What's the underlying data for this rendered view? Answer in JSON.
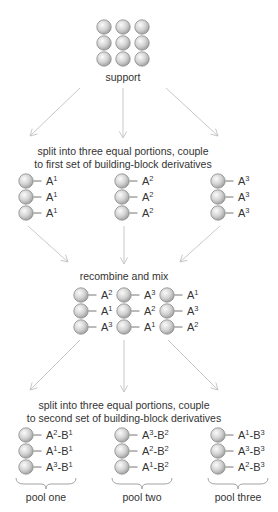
{
  "support": {
    "label": "support",
    "grid": {
      "rows": 3,
      "cols": 3
    }
  },
  "step1": {
    "caption_line1": "split into three equal portions, couple",
    "caption_line2": "to first set of building-block derivatives",
    "groups": [
      {
        "labels": [
          [
            "A",
            "1",
            ""
          ],
          [
            "A",
            "1",
            ""
          ],
          [
            "A",
            "1",
            ""
          ]
        ]
      },
      {
        "labels": [
          [
            "A",
            "2",
            ""
          ],
          [
            "A",
            "2",
            ""
          ],
          [
            "A",
            "2",
            ""
          ]
        ]
      },
      {
        "labels": [
          [
            "A",
            "3",
            ""
          ],
          [
            "A",
            "3",
            ""
          ],
          [
            "A",
            "3",
            ""
          ]
        ]
      }
    ]
  },
  "step2": {
    "caption": "recombine and mix",
    "columns": [
      {
        "labels": [
          [
            "A",
            "2"
          ],
          [
            "A",
            "1"
          ],
          [
            "A",
            "3"
          ]
        ]
      },
      {
        "labels": [
          [
            "A",
            "3"
          ],
          [
            "A",
            "2"
          ],
          [
            "A",
            "1"
          ]
        ]
      },
      {
        "labels": [
          [
            "A",
            "1"
          ],
          [
            "A",
            "3"
          ],
          [
            "A",
            "2"
          ]
        ]
      }
    ]
  },
  "step3": {
    "caption_line1": "split into three equal portions, couple",
    "caption_line2": "to second set of building-block derivatives",
    "pools": [
      {
        "name": "pool one",
        "labels": [
          [
            "2",
            "1"
          ],
          [
            "1",
            "1"
          ],
          [
            "3",
            "1"
          ]
        ]
      },
      {
        "name": "pool two",
        "labels": [
          [
            "3",
            "2"
          ],
          [
            "2",
            "2"
          ],
          [
            "1",
            "2"
          ]
        ]
      },
      {
        "name": "pool three",
        "labels": [
          [
            "1",
            "3"
          ],
          [
            "3",
            "3"
          ],
          [
            "2",
            "3"
          ]
        ]
      }
    ]
  },
  "colors": {
    "bead_light": "#f4f4f4",
    "bead_dark": "#9a9a9a",
    "bead_stroke": "#8c8c8c",
    "arrow": "#c8c8c8",
    "text": "#333333"
  }
}
